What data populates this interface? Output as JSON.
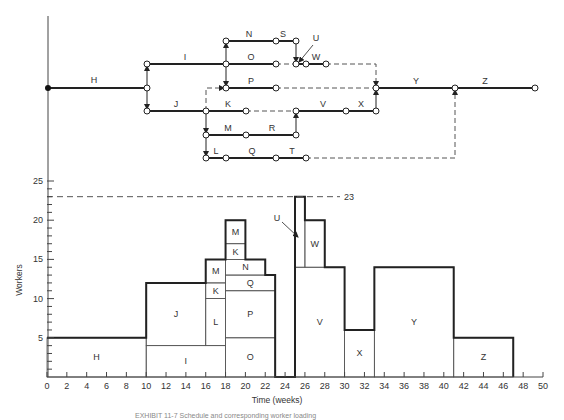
{
  "network": {
    "activities": [
      {
        "id": "H",
        "label": "H",
        "from": "n0",
        "to": "n1",
        "style": "solid"
      },
      {
        "id": "I",
        "label": "I",
        "from": "n1u",
        "to": "n2",
        "style": "solid"
      },
      {
        "id": "J",
        "label": "J",
        "from": "n1d",
        "to": "n3",
        "style": "solid"
      },
      {
        "id": "N",
        "label": "N",
        "from": "n2u",
        "to": "nN",
        "style": "solid"
      },
      {
        "id": "S",
        "label": "S",
        "from": "nN",
        "to": "nS",
        "style": "solid"
      },
      {
        "id": "O",
        "label": "O",
        "from": "n2",
        "to": "nO",
        "style": "solid"
      },
      {
        "id": "U",
        "label": "U",
        "from": "nU",
        "to": "nU2",
        "style": "solid"
      },
      {
        "id": "W",
        "label": "W",
        "from": "nU2",
        "to": "nW",
        "style": "solid"
      },
      {
        "id": "P",
        "label": "P",
        "from": "n2d",
        "to": "nP",
        "style": "solid"
      },
      {
        "id": "K",
        "label": "K",
        "from": "n3",
        "to": "nK",
        "style": "solid"
      },
      {
        "id": "V",
        "label": "V",
        "from": "nR",
        "to": "nV",
        "style": "solid"
      },
      {
        "id": "X",
        "label": "X",
        "from": "nV",
        "to": "nX",
        "style": "solid"
      },
      {
        "id": "M",
        "label": "M",
        "from": "n3m",
        "to": "nM",
        "style": "solid"
      },
      {
        "id": "R",
        "label": "R",
        "from": "nM",
        "to": "nR2",
        "style": "solid"
      },
      {
        "id": "L",
        "label": "L",
        "from": "n3l",
        "to": "nL",
        "style": "solid"
      },
      {
        "id": "Q",
        "label": "Q",
        "from": "nL",
        "to": "nQ",
        "style": "solid"
      },
      {
        "id": "T",
        "label": "T",
        "from": "nQ",
        "to": "nT",
        "style": "solid"
      },
      {
        "id": "Y",
        "label": "Y",
        "from": "nY0",
        "to": "nY",
        "style": "solid"
      },
      {
        "id": "Z",
        "label": "Z",
        "from": "nY",
        "to": "nZ",
        "style": "solid"
      }
    ]
  },
  "chart_data": {
    "type": "bar",
    "title": "",
    "xlabel": "Time (weeks)",
    "ylabel": "Workers",
    "xlim": [
      0,
      50
    ],
    "ylim": [
      0,
      25
    ],
    "x_ticks": [
      0,
      2,
      4,
      6,
      8,
      10,
      12,
      14,
      16,
      18,
      20,
      22,
      24,
      26,
      28,
      30,
      32,
      34,
      36,
      38,
      40,
      42,
      44,
      46,
      48,
      50
    ],
    "y_ticks": [
      5,
      10,
      15,
      20,
      25
    ],
    "limit_line": {
      "value": 23,
      "label": "23",
      "style": "dashed"
    },
    "blocks": [
      {
        "activity": "H",
        "start": 0,
        "end": 10,
        "bottom": 0,
        "top": 5
      },
      {
        "activity": "I",
        "start": 10,
        "end": 18,
        "bottom": 0,
        "top": 4
      },
      {
        "activity": "J",
        "start": 10,
        "end": 16,
        "bottom": 4,
        "top": 12
      },
      {
        "activity": "L",
        "start": 16,
        "end": 18,
        "bottom": 4,
        "top": 10
      },
      {
        "activity": "K",
        "start": 16,
        "end": 18,
        "bottom": 10,
        "top": 12
      },
      {
        "activity": "M",
        "start": 16,
        "end": 18,
        "bottom": 12,
        "top": 15
      },
      {
        "activity": "O",
        "start": 18,
        "end": 23,
        "bottom": 0,
        "top": 5
      },
      {
        "activity": "P",
        "start": 18,
        "end": 23,
        "bottom": 5,
        "top": 11
      },
      {
        "activity": "Q",
        "start": 18,
        "end": 23,
        "bottom": 11,
        "top": 13
      },
      {
        "activity": "N",
        "start": 18,
        "end": 22,
        "bottom": 13,
        "top": 15
      },
      {
        "activity": "K",
        "start": 18,
        "end": 20,
        "bottom": 15,
        "top": 17
      },
      {
        "activity": "M",
        "start": 18,
        "end": 20,
        "bottom": 17,
        "top": 20
      },
      {
        "activity": "V",
        "start": 25,
        "end": 30,
        "bottom": 0,
        "top": 14
      },
      {
        "activity": "U",
        "start": 25,
        "end": 26,
        "bottom": 14,
        "top": 23
      },
      {
        "activity": "W",
        "start": 26,
        "end": 28,
        "bottom": 14,
        "top": 20
      },
      {
        "activity": "X",
        "start": 30,
        "end": 33,
        "bottom": 0,
        "top": 6
      },
      {
        "activity": "Y",
        "start": 33,
        "end": 41,
        "bottom": 0,
        "top": 14
      },
      {
        "activity": "Z",
        "start": 41,
        "end": 47,
        "bottom": 0,
        "top": 5
      }
    ],
    "envelope": [
      [
        0,
        5
      ],
      [
        10,
        5
      ],
      [
        10,
        12
      ],
      [
        16,
        12
      ],
      [
        16,
        15
      ],
      [
        18,
        15
      ],
      [
        18,
        20
      ],
      [
        20,
        20
      ],
      [
        20,
        15
      ],
      [
        22,
        15
      ],
      [
        22,
        13
      ],
      [
        23,
        13
      ],
      [
        23,
        0
      ],
      [
        25,
        0
      ],
      [
        25,
        23
      ],
      [
        26,
        23
      ],
      [
        26,
        20
      ],
      [
        28,
        20
      ],
      [
        28,
        14
      ],
      [
        30,
        14
      ],
      [
        30,
        6
      ],
      [
        33,
        6
      ],
      [
        33,
        14
      ],
      [
        41,
        14
      ],
      [
        41,
        5
      ],
      [
        47,
        5
      ],
      [
        47,
        0
      ]
    ],
    "annotations": [
      {
        "text": "U",
        "points_to": "U block"
      }
    ]
  },
  "caption": "EXHIBIT 11-7 Schedule and corresponding worker loading"
}
